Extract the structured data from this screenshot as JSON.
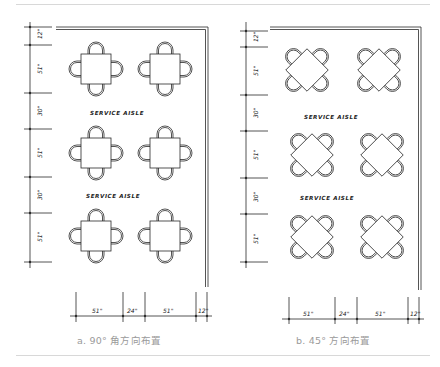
{
  "figure": {
    "panels": [
      {
        "id": "a",
        "caption": "a. 90° 角方向布置",
        "orientation_deg": 90,
        "aisle_labels": [
          "SERVICE AISLE",
          "SERVICE AISLE"
        ],
        "vertical_dims": [
          "12\"",
          "51\"",
          "30\"",
          "51\"",
          "30\"",
          "51\""
        ],
        "horizontal_dims": [
          "51\"",
          "24\"",
          "51\"",
          "12\""
        ],
        "table_rows": 3,
        "table_cols": 2,
        "chairs_per_table": 4
      },
      {
        "id": "b",
        "caption": "b. 45° 方向布置",
        "orientation_deg": 45,
        "aisle_labels": [
          "SERVICE AISLE",
          "SERVICE AISLE"
        ],
        "vertical_dims": [
          "12\"",
          "51\"",
          "30\"",
          "51\"",
          "30\"",
          "51\""
        ],
        "horizontal_dims": [
          "51\"",
          "24\"",
          "51\"",
          "12\""
        ],
        "table_rows": 3,
        "table_cols": 2,
        "chairs_per_table": 4
      }
    ],
    "colors": {
      "line": "#2a2a2a",
      "caption": "#9a9a9a",
      "rule": "#d8d8d8"
    }
  }
}
